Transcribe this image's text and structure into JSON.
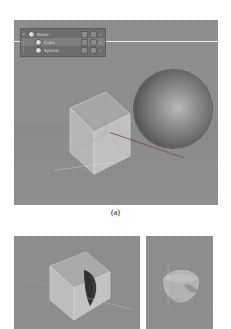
{
  "figure": {
    "caption_a": "(a)"
  },
  "viewport": {
    "name": "3d-viewport",
    "background_color": "#8e8e8e",
    "objects": [
      {
        "name": "Cube",
        "shading": "wireframe-solid",
        "fill": "#b4b4b4"
      },
      {
        "name": "Sphere",
        "shading": "smooth-shaded",
        "fill": "#6f6f6f"
      }
    ]
  },
  "outliner": {
    "title": "Outliner",
    "rows": [
      {
        "label": "Boole",
        "indent": 0,
        "selected": false,
        "icons": [
          "render-visibility-icon",
          "viewport-visibility-icon",
          "checkbox-icon"
        ]
      },
      {
        "label": "Cube",
        "indent": 1,
        "selected": true,
        "icons": [
          "render-visibility-icon",
          "viewport-visibility-icon",
          "checkbox-icon"
        ]
      },
      {
        "label": "Sphere",
        "indent": 1,
        "selected": false,
        "icons": [
          "render-visibility-icon",
          "viewport-visibility-icon",
          "checkbox-icon"
        ]
      }
    ]
  },
  "bottom_panels": [
    {
      "name": "boolean-difference-result",
      "background_color": "#8e8e8e",
      "description": "Cube with concave spherical cut"
    },
    {
      "name": "boolean-intersect-result",
      "background_color": "#8e8e8e",
      "description": "Lens shaped intersection solid"
    }
  ]
}
